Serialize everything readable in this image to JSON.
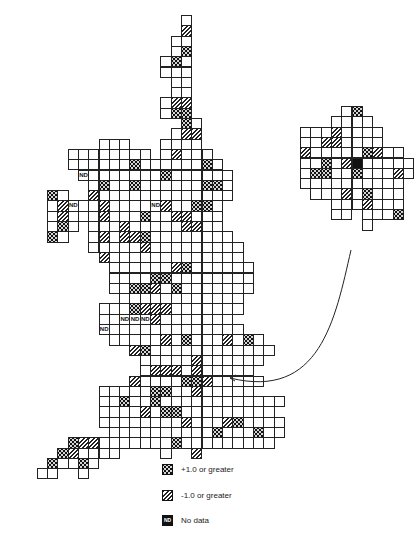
{
  "figure": {
    "cell_size": 10.3,
    "main_map": {
      "origin_x": 47,
      "origin_y": 15,
      "rows": [
        {
          "r": 0,
          "spans": [
            [
              13,
              13
            ]
          ]
        },
        {
          "r": 1,
          "spans": [
            [
              13,
              13
            ]
          ],
          "neg": [
            13
          ]
        },
        {
          "r": 2,
          "spans": [
            [
              12,
              13
            ]
          ]
        },
        {
          "r": 3,
          "spans": [
            [
              12,
              13
            ]
          ],
          "pos": [
            13
          ]
        },
        {
          "r": 4,
          "spans": [
            [
              11,
              13
            ]
          ],
          "pos": [
            12
          ]
        },
        {
          "r": 5,
          "spans": [
            [
              11,
              13
            ]
          ]
        },
        {
          "r": 6,
          "spans": [
            [
              12,
              13
            ]
          ]
        },
        {
          "r": 7,
          "spans": [
            [
              12,
              13
            ]
          ]
        },
        {
          "r": 8,
          "spans": [
            [
              11,
              13
            ]
          ],
          "neg": [
            12,
            13
          ]
        },
        {
          "r": 9,
          "spans": [
            [
              11,
              13
            ]
          ],
          "pos": [
            12,
            13
          ]
        },
        {
          "r": 10,
          "spans": [
            [
              13,
              14
            ]
          ],
          "pos": [
            13
          ]
        },
        {
          "r": 11,
          "spans": [
            [
              12,
              14
            ]
          ],
          "neg": [
            13,
            14
          ]
        },
        {
          "r": 12,
          "spans": [
            [
              5,
              7
            ],
            [
              11,
              14
            ]
          ]
        },
        {
          "r": 13,
          "spans": [
            [
              2,
              9
            ],
            [
              11,
              15
            ]
          ],
          "neg": [
            12
          ]
        },
        {
          "r": 14,
          "spans": [
            [
              2,
              16
            ]
          ],
          "pos": [
            8,
            15
          ]
        },
        {
          "r": 15,
          "spans": [
            [
              3,
              17
            ]
          ],
          "nd": [
            3
          ],
          "pos": [
            11
          ]
        },
        {
          "r": 16,
          "spans": [
            [
              4,
              17
            ]
          ],
          "pos": [
            5,
            8,
            15,
            16
          ]
        },
        {
          "r": 17,
          "spans": [
            [
              0,
              1
            ],
            [
              4,
              17
            ]
          ],
          "pos": [
            0
          ],
          "neg": [
            4
          ]
        },
        {
          "r": 18,
          "spans": [
            [
              0,
              16
            ]
          ],
          "neg": [
            1,
            5,
            11
          ],
          "nd": [
            2,
            10
          ],
          "pos": [
            14,
            15
          ]
        },
        {
          "r": 19,
          "spans": [
            [
              0,
              16
            ]
          ],
          "neg": [
            1,
            5,
            12,
            13
          ],
          "pos": [
            9
          ]
        },
        {
          "r": 20,
          "spans": [
            [
              0,
              2
            ],
            [
              4,
              16
            ]
          ],
          "pos": [
            1
          ],
          "neg": [
            7,
            13,
            14
          ]
        },
        {
          "r": 21,
          "spans": [
            [
              0,
              1
            ],
            [
              4,
              17
            ]
          ],
          "pos": [
            0
          ],
          "neg": [
            5,
            7,
            8
          ],
          "pos2": [
            9
          ]
        },
        {
          "r": 22,
          "spans": [
            [
              4,
              18
            ]
          ],
          "neg": [
            9
          ]
        },
        {
          "r": 23,
          "spans": [
            [
              5,
              18
            ]
          ],
          "neg": [
            5
          ]
        },
        {
          "r": 24,
          "spans": [
            [
              6,
              19
            ]
          ],
          "neg": [
            12
          ],
          "pos": [
            13
          ]
        },
        {
          "r": 25,
          "spans": [
            [
              6,
              19
            ]
          ],
          "pos": [
            10,
            11
          ]
        },
        {
          "r": 26,
          "spans": [
            [
              6,
              19
            ]
          ],
          "neg": [
            10
          ],
          "pos": [
            8,
            9,
            12
          ]
        },
        {
          "r": 27,
          "spans": [
            [
              7,
              18
            ]
          ]
        },
        {
          "r": 28,
          "spans": [
            [
              5,
              18
            ]
          ],
          "pos": [
            8
          ],
          "neg": [
            9,
            10,
            11
          ]
        },
        {
          "r": 29,
          "spans": [
            [
              5,
              17
            ]
          ],
          "nd": [
            7,
            8,
            9
          ],
          "neg": [
            10
          ]
        },
        {
          "r": 30,
          "spans": [
            [
              5,
              18
            ]
          ],
          "nd": [
            5
          ]
        },
        {
          "r": 31,
          "spans": [
            [
              6,
              20
            ]
          ],
          "neg": [
            11,
            17
          ],
          "pos": [
            13,
            19
          ]
        },
        {
          "r": 32,
          "spans": [
            [
              8,
              21
            ]
          ],
          "neg": [
            8
          ],
          "pos": [
            9
          ]
        },
        {
          "r": 33,
          "spans": [
            [
              9,
              20
            ]
          ],
          "neg": [
            14
          ]
        },
        {
          "r": 34,
          "spans": [
            [
              9,
              19
            ]
          ],
          "neg": [
            10,
            11,
            12,
            14
          ]
        },
        {
          "r": 35,
          "spans": [
            [
              8,
              20
            ]
          ],
          "neg": [
            8
          ],
          "pos": [
            13,
            14
          ],
          "neg2": [
            15
          ]
        },
        {
          "r": 36,
          "spans": [
            [
              5,
              19
            ]
          ],
          "pos": [
            10,
            11
          ],
          "neg": [
            14
          ]
        },
        {
          "r": 37,
          "spans": [
            [
              5,
              22
            ]
          ],
          "pos": [
            7,
            10
          ]
        },
        {
          "r": 38,
          "spans": [
            [
              5,
              21
            ]
          ],
          "pos": [
            11,
            12
          ],
          "neg": [
            9
          ]
        },
        {
          "r": 39,
          "spans": [
            [
              5,
              22
            ]
          ],
          "neg": [
            13,
            17
          ],
          "pos": [
            18
          ]
        },
        {
          "r": 40,
          "spans": [
            [
              6,
              22
            ]
          ],
          "pos": [
            16,
            20
          ]
        },
        {
          "r": 41,
          "spans": [
            [
              2,
              21
            ]
          ],
          "pos": [
            2,
            12
          ],
          "neg": [
            3,
            4
          ]
        },
        {
          "r": 42,
          "spans": [
            [
              1,
              6
            ],
            [
              11,
              11
            ],
            [
              14,
              14
            ]
          ],
          "pos": [
            1
          ],
          "neg": [
            2
          ],
          "neg2": [
            14
          ]
        },
        {
          "r": 43,
          "spans": [
            [
              0,
              4
            ]
          ],
          "pos": [
            0,
            3
          ]
        },
        {
          "r": 44,
          "spans": [
            [
              -1,
              0
            ],
            [
              3,
              3
            ]
          ]
        }
      ]
    },
    "inset_map": {
      "origin_x": 300,
      "origin_y": 106,
      "rows": [
        {
          "r": 0,
          "spans": [
            [
              4,
              5
            ]
          ],
          "pos": [
            5
          ]
        },
        {
          "r": 1,
          "spans": [
            [
              3,
              6
            ]
          ]
        },
        {
          "r": 2,
          "spans": [
            [
              0,
              7
            ]
          ],
          "neg": [
            3
          ]
        },
        {
          "r": 3,
          "spans": [
            [
              0,
              7
            ]
          ],
          "neg": [
            2,
            3
          ]
        },
        {
          "r": 4,
          "spans": [
            [
              0,
              9
            ]
          ],
          "neg": [
            0,
            7
          ],
          "pos": [
            6
          ]
        },
        {
          "r": 5,
          "spans": [
            [
              0,
              10
            ]
          ],
          "pos": [
            2
          ],
          "neg": [
            4
          ],
          "blk": [
            5
          ]
        },
        {
          "r": 6,
          "spans": [
            [
              0,
              10
            ]
          ],
          "pos": [
            1,
            2,
            5
          ],
          "neg": [
            9
          ]
        },
        {
          "r": 7,
          "spans": [
            [
              0,
              9
            ]
          ]
        },
        {
          "r": 8,
          "spans": [
            [
              1,
              9
            ]
          ],
          "neg": [
            4
          ],
          "pos": [
            6
          ]
        },
        {
          "r": 9,
          "spans": [
            [
              3,
              9
            ]
          ],
          "neg": [
            6
          ]
        },
        {
          "r": 10,
          "spans": [
            [
              3,
              4
            ],
            [
              6,
              9
            ]
          ],
          "pos": [
            9
          ]
        },
        {
          "r": 11,
          "spans": [
            [
              6,
              6
            ]
          ]
        }
      ]
    },
    "legend": [
      {
        "swatch": "pos",
        "label": "+1.0 or greater"
      },
      {
        "swatch": "neg",
        "label": "-1.0 or greater"
      },
      {
        "swatch": "nd",
        "label": "No data",
        "badge": "ND"
      }
    ],
    "nd_label": "ND"
  }
}
